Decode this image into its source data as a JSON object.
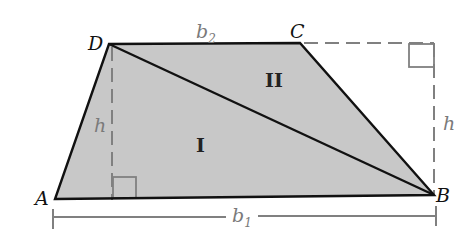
{
  "diagram": {
    "type": "trapezoid-area-decomposition",
    "colors": {
      "fill": "#c8c8c8",
      "edge": "#111111",
      "auxiliary": "#808080",
      "background": "#ffffff"
    },
    "vertices": {
      "A": {
        "label": "A",
        "x": 55,
        "y": 199
      },
      "B": {
        "label": "B",
        "x": 434,
        "y": 195
      },
      "C": {
        "label": "C",
        "x": 300,
        "y": 43
      },
      "D": {
        "label": "D",
        "x": 109,
        "y": 44
      }
    },
    "regions": {
      "I": {
        "label": "I"
      },
      "II": {
        "label": "II"
      }
    },
    "measures": {
      "top_base": {
        "label": "b",
        "sub": "2"
      },
      "bottom_base": {
        "label": "b",
        "sub": "1"
      },
      "height_left": {
        "label": "h"
      },
      "height_right": {
        "label": "h"
      }
    },
    "diagonal": "DB",
    "right_angle_markers": 2
  }
}
